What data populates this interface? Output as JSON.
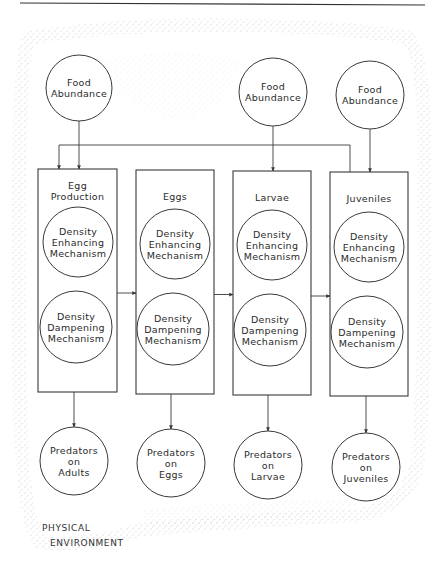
{
  "diagram": {
    "header_rule": true,
    "environment_label": {
      "line1": "PHYSICAL",
      "line2": "ENVIRONMENT"
    },
    "food_nodes": [
      {
        "id": "food-1",
        "label1": "Food",
        "label2": "Abundance",
        "cx": 79,
        "cy": 88,
        "r": 33
      },
      {
        "id": "food-2",
        "label1": "Food",
        "label2": "Abundance",
        "cx": 273,
        "cy": 92,
        "r": 34
      },
      {
        "id": "food-3",
        "label1": "Food",
        "label2": "Abundance",
        "cx": 370,
        "cy": 95,
        "r": 34
      }
    ],
    "stages": [
      {
        "id": "egg-production",
        "title1": "Egg",
        "title2": "Production",
        "x": 38,
        "y": 169,
        "w": 79,
        "h": 223,
        "enhancing": {
          "l1": "Density",
          "l2": "Enhancing",
          "l3": "Mechanism",
          "cx": 78,
          "cy": 242,
          "r": 35
        },
        "dampening": {
          "l1": "Density",
          "l2": "Dampening",
          "l3": "Mechanism",
          "cx": 76,
          "cy": 327,
          "r": 36
        }
      },
      {
        "id": "eggs",
        "title1": "Eggs",
        "title2": "",
        "x": 136,
        "y": 170,
        "w": 78,
        "h": 224,
        "enhancing": {
          "l1": "Density",
          "l2": "Enhancing",
          "l3": "Mechanism",
          "cx": 175,
          "cy": 244,
          "r": 35
        },
        "dampening": {
          "l1": "Density",
          "l2": "Dampening",
          "l3": "Mechanism",
          "cx": 173,
          "cy": 329,
          "r": 36
        }
      },
      {
        "id": "larvae",
        "title1": "Larvae",
        "title2": "",
        "x": 233,
        "y": 171,
        "w": 78,
        "h": 224,
        "enhancing": {
          "l1": "Density",
          "l2": "Enhancing",
          "l3": "Mechanism",
          "cx": 272,
          "cy": 245,
          "r": 35
        },
        "dampening": {
          "l1": "Density",
          "l2": "Dampening",
          "l3": "Mechanism",
          "cx": 270,
          "cy": 330,
          "r": 36
        }
      },
      {
        "id": "juveniles",
        "title1": "Juveniles",
        "title2": "",
        "x": 330,
        "y": 172,
        "w": 78,
        "h": 224,
        "enhancing": {
          "l1": "Density",
          "l2": "Enhancing",
          "l3": "Mechanism",
          "cx": 369,
          "cy": 247,
          "r": 35
        },
        "dampening": {
          "l1": "Density",
          "l2": "Dampening",
          "l3": "Mechanism",
          "cx": 367,
          "cy": 332,
          "r": 36
        }
      }
    ],
    "predator_nodes": [
      {
        "id": "pred-adults",
        "label1": "Predators",
        "label2": "on",
        "label3": "Adults",
        "cx": 74,
        "cy": 461,
        "r": 34
      },
      {
        "id": "pred-eggs",
        "label1": "Predators",
        "label2": "on",
        "label3": "Eggs",
        "cx": 171,
        "cy": 463,
        "r": 34
      },
      {
        "id": "pred-larvae",
        "label1": "Predators",
        "label2": "on",
        "label3": "Larvae",
        "cx": 268,
        "cy": 465,
        "r": 34
      },
      {
        "id": "pred-juveniles",
        "label1": "Predators",
        "label2": "on",
        "label3": "Juveniles",
        "cx": 366,
        "cy": 467,
        "r": 34
      }
    ],
    "colors": {
      "line": "#3a3a3a",
      "stipple": "#9a9a9a",
      "text": "#2b2b2b"
    }
  }
}
